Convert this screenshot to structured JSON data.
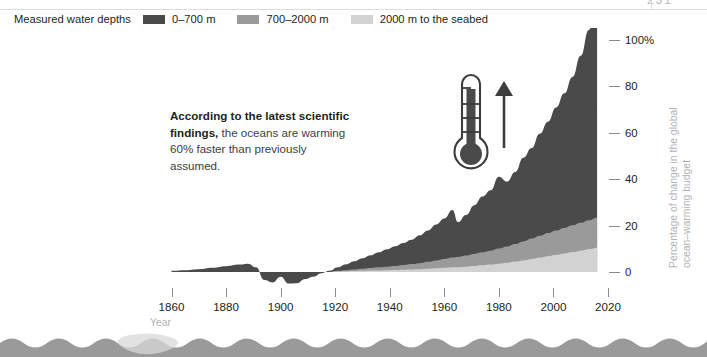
{
  "page": {
    "cropped_corner_text": "231"
  },
  "legend": {
    "title": "Measured water depths",
    "items": [
      {
        "label": "0–700 m",
        "color": "#4a4a4a"
      },
      {
        "label": "700–2000 m",
        "color": "#9a9a9a"
      },
      {
        "label": "2000 m to the seabed",
        "color": "#d2d2d2"
      }
    ]
  },
  "annotation": {
    "bold_part": "According to the latest scientific findings,",
    "rest_part": " the oceans are warming 60% faster than previously assumed."
  },
  "icons": {
    "thermometer": "thermometer-icon",
    "arrow_up": "arrow-up-icon"
  },
  "axes": {
    "x_title": "Year",
    "y_title_line1": "Percentage of change in the global",
    "y_title_line2": "ocean–warming budget",
    "x_ticks": [
      "1860",
      "1880",
      "1900",
      "1920",
      "1940",
      "1960",
      "1980",
      "2000",
      "2020"
    ],
    "y_ticks": [
      "0",
      "20",
      "40",
      "60",
      "80",
      "100%"
    ]
  },
  "chart_data": {
    "type": "area",
    "title": "",
    "subtitle": "",
    "xlabel": "Year",
    "ylabel": "Percentage of change in the global ocean-warming budget",
    "xlim": [
      1855,
      2020
    ],
    "ylim": [
      -8,
      104
    ],
    "grid": false,
    "stacked": true,
    "legend_position": "top-left",
    "x": [
      1860,
      1865,
      1870,
      1875,
      1880,
      1885,
      1888,
      1891,
      1894,
      1897,
      1900,
      1903,
      1906,
      1909,
      1912,
      1915,
      1918,
      1921,
      1924,
      1927,
      1930,
      1933,
      1936,
      1939,
      1942,
      1945,
      1948,
      1951,
      1954,
      1957,
      1960,
      1963,
      1965,
      1968,
      1971,
      1974,
      1977,
      1980,
      1983,
      1986,
      1989,
      1992,
      1995,
      1998,
      2001,
      2004,
      2007,
      2010,
      2013,
      2016
    ],
    "series": [
      {
        "name": "2000 m to the seabed",
        "color": "#d2d2d2",
        "values": [
          0,
          0,
          0,
          0,
          0,
          0,
          0,
          0,
          0,
          0,
          0,
          0,
          0,
          0,
          0,
          0,
          0,
          0.2,
          0.3,
          0.4,
          0.5,
          0.6,
          0.7,
          0.8,
          0.9,
          1.0,
          1.1,
          1.2,
          1.4,
          1.6,
          1.8,
          2.0,
          2.1,
          2.3,
          2.6,
          2.9,
          3.2,
          3.6,
          4.0,
          4.5,
          5.0,
          5.6,
          6.2,
          6.8,
          7.4,
          8.0,
          8.6,
          9.2,
          9.8,
          10.4
        ]
      },
      {
        "name": "700–2000 m",
        "color": "#9a9a9a",
        "values": [
          0,
          0,
          0,
          0,
          0,
          0,
          0,
          0,
          0,
          0,
          0,
          0,
          0,
          0,
          0,
          0,
          0,
          0.3,
          0.5,
          0.7,
          0.9,
          1.1,
          1.3,
          1.5,
          1.7,
          2.0,
          2.3,
          2.6,
          3.0,
          3.4,
          3.8,
          4.2,
          4.4,
          4.8,
          5.2,
          5.6,
          6.0,
          6.5,
          7.0,
          7.6,
          8.2,
          8.8,
          9.4,
          10.0,
          10.5,
          11.0,
          11.5,
          12.0,
          12.5,
          13.0
        ]
      },
      {
        "name": "0–700 m",
        "color": "#4a4a4a",
        "values": [
          0.5,
          0.8,
          1.2,
          1.8,
          2.5,
          3.2,
          3.6,
          2.0,
          -3.5,
          -4.5,
          -2.0,
          -5.0,
          -4.8,
          -3.0,
          -2.0,
          -0.5,
          0.5,
          1.5,
          2.5,
          3.5,
          4.5,
          5.5,
          6.5,
          7.5,
          8.5,
          9.5,
          10.5,
          12.0,
          13.5,
          15.5,
          17.5,
          20.5,
          15.0,
          17.5,
          21.0,
          24.0,
          26.0,
          31.0,
          28.0,
          31.0,
          36.0,
          39.0,
          44.0,
          48.0,
          53.0,
          58.0,
          64.0,
          72.0,
          82.0,
          100.0
        ]
      }
    ],
    "annotations": [
      {
        "text": "According to the latest scientific findings, the oceans are warming 60% faster than previously assumed.",
        "x": 1880,
        "y": 60
      }
    ]
  }
}
